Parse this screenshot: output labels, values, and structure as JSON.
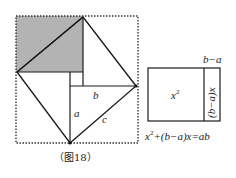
{
  "figure": {
    "caption": "（图18）",
    "left_figure": {
      "labels": {
        "a": "a",
        "b": "b",
        "c": "c"
      },
      "shade_color": "#b3b3b3",
      "line_color": "#1a1a1a"
    },
    "right_figure": {
      "top_label": "b−a",
      "square_label_base": "x",
      "square_label_exp": "2",
      "strip_label": "(b−a)x",
      "equation_prefix": "x",
      "equation_exp": "2",
      "equation_rest": "+(b−a)x=ab"
    }
  }
}
